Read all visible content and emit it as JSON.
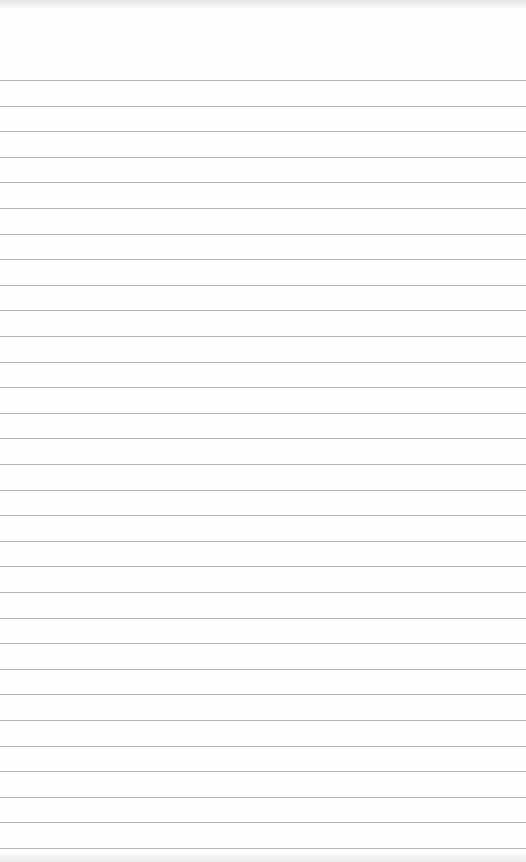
{
  "page": {
    "type": "lined-notepad-paper",
    "background_color": "#fefefe",
    "rule_color": "#b4b4b4",
    "first_rule_y": 80,
    "rule_spacing": 25.6,
    "rule_count": 31,
    "text": ""
  }
}
